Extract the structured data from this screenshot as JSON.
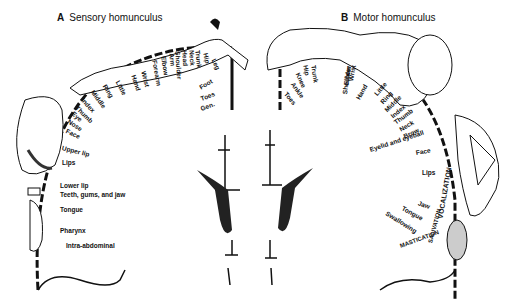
{
  "panel_a": {
    "letter": "A",
    "title": "Sensory homunculus",
    "labels": [
      "Little",
      "Ring",
      "Middle",
      "Index",
      "Thumb",
      "Eye",
      "Nose",
      "Face",
      "Upper lip",
      "Lips",
      "Lower lip",
      "Teeth, gums, and jaw",
      "Tongue",
      "Pharynx",
      "Intra-abdominal",
      "Hand",
      "Wrist",
      "Forearm",
      "Elbow",
      "Arm",
      "Shoulder",
      "Head",
      "Neck",
      "Trunk",
      "Hip",
      "Leg",
      "Foot",
      "Toes",
      "Gen."
    ]
  },
  "panel_b": {
    "letter": "B",
    "title": "Motor homunculus",
    "labels": [
      "Toes",
      "Ankle",
      "Knee",
      "Hip",
      "Trunk",
      "Shoulder",
      "Elbow",
      "Wrist",
      "Hand",
      "Little",
      "Ring",
      "Middle",
      "Index",
      "Thumb",
      "Neck",
      "Brow",
      "Eyelid and eyeball",
      "Face",
      "Lips",
      "Jaw",
      "Tongue",
      "Swallowing",
      "VOCALIZATION",
      "SALIVATION",
      "MASTICATION"
    ]
  }
}
